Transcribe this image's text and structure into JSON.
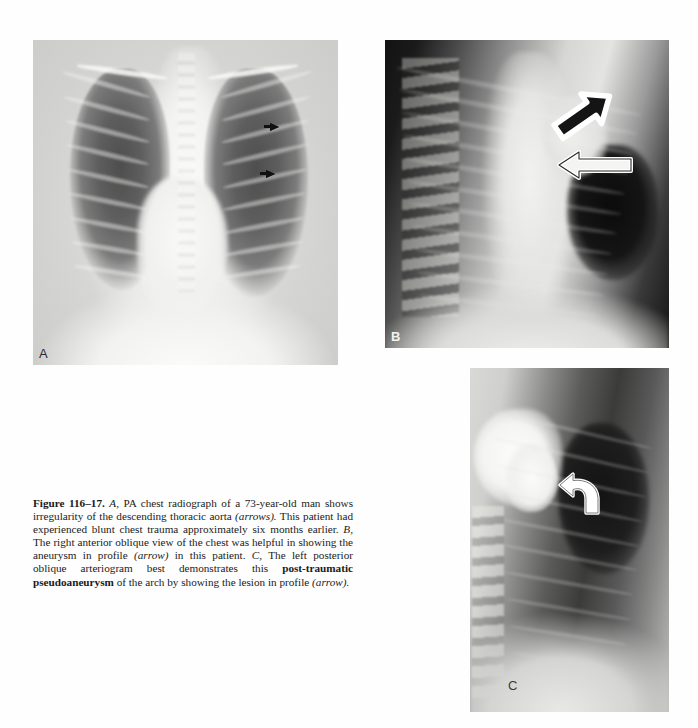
{
  "figure": {
    "number_label": "Figure 116–17.",
    "caption_segments": [
      {
        "text": "Figure 116–17.",
        "style": "bold"
      },
      {
        "text": " ",
        "style": "normal"
      },
      {
        "text": "A,",
        "style": "italic"
      },
      {
        "text": " PA chest radiograph of a 73-year-old man shows irregularity of the descending thoracic aorta ",
        "style": "normal"
      },
      {
        "text": "(arrows).",
        "style": "italic"
      },
      {
        "text": " This patient had experienced blunt chest trauma approximately six months earlier. ",
        "style": "normal"
      },
      {
        "text": "B,",
        "style": "italic"
      },
      {
        "text": " The right anterior oblique view of the chest was helpful in showing the aneurysm in profile ",
        "style": "normal"
      },
      {
        "text": "(arrow)",
        "style": "italic"
      },
      {
        "text": " in this patient. ",
        "style": "normal"
      },
      {
        "text": "C,",
        "style": "italic"
      },
      {
        "text": " The left posterior oblique arteriogram best demonstrates this ",
        "style": "normal"
      },
      {
        "text": "post-traumatic pseudoaneurysm",
        "style": "bold"
      },
      {
        "text": " of the arch by showing the lesion in profile ",
        "style": "normal"
      },
      {
        "text": "(arrow).",
        "style": "italic"
      }
    ],
    "caption_plain": "Figure 116–17. A, PA chest radiograph of a 73-year-old man shows irregularity of the descending thoracic aorta (arrows). This patient had experienced blunt chest trauma approximately six months earlier. B, The right anterior oblique view of the chest was helpful in showing the aneurysm in profile (arrow) in this patient. C, The left posterior oblique arteriogram best demonstrates this post-traumatic pseudoaneurysm of the arch by showing the lesion in profile (arrow)."
  },
  "panels": [
    {
      "id": "a",
      "label": "A",
      "modality": "PA chest radiograph",
      "description": "Posteroanterior chest radiograph of a 73-year-old man showing irregularity of the descending thoracic aorta",
      "annotation_count": 2,
      "annotation_type": "solid black arrows",
      "label_position": "bottom-left"
    },
    {
      "id": "b",
      "label": "B",
      "modality": "Right anterior oblique chest radiograph",
      "description": "Right anterior oblique view of the chest showing the aneurysm in profile",
      "annotation_count": 2,
      "annotation_type": "white-outlined arrows",
      "label_position": "bottom-left"
    },
    {
      "id": "c",
      "label": "C",
      "modality": "Left posterior oblique arteriogram",
      "description": "Left posterior oblique arteriogram demonstrating the post-traumatic pseudoaneurysm of the arch in profile",
      "annotation_count": 1,
      "annotation_type": "white-outlined curved arrow",
      "label_position": "bottom-left"
    }
  ],
  "colors": {
    "page_background": "#ffffff",
    "caption_text": "#1a1a1a",
    "arrow_outline": "#ffffff",
    "arrow_fill_dark": "#111111"
  }
}
